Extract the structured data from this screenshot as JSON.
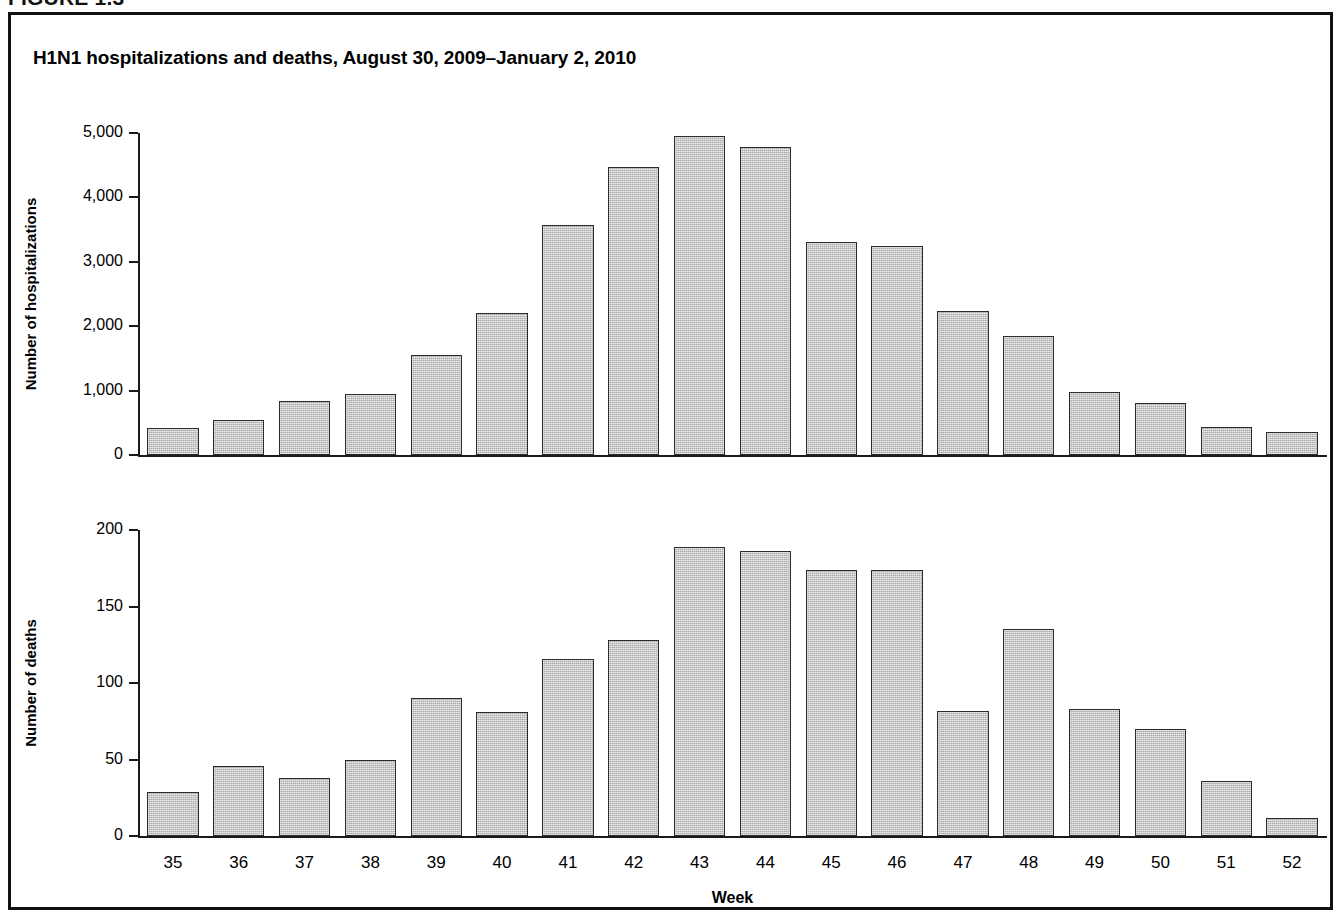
{
  "figure": {
    "header_label": "FIGURE 1.3",
    "title": "H1N1 hospitalizations and deaths, August 30, 2009–January 2, 2010"
  },
  "chart_data": [
    {
      "type": "bar",
      "panel": "top",
      "title": "",
      "xlabel": "",
      "ylabel": "Number of hospitalizations",
      "categories": [
        "35",
        "36",
        "37",
        "38",
        "39",
        "40",
        "41",
        "42",
        "43",
        "44",
        "45",
        "46",
        "47",
        "48",
        "49",
        "50",
        "51",
        "52"
      ],
      "values": [
        420,
        540,
        840,
        950,
        1550,
        2210,
        3570,
        4470,
        4960,
        4780,
        3300,
        3240,
        2230,
        1850,
        980,
        810,
        440,
        350
      ],
      "ylim": [
        0,
        5000
      ],
      "yticks": [
        0,
        1000,
        2000,
        3000,
        4000,
        5000
      ],
      "ytick_labels": [
        "0",
        "1,000",
        "2,000",
        "3,000",
        "4,000",
        "5,000"
      ],
      "grid": false,
      "legend": "none",
      "bar_color": "#a9a9a9",
      "bar_edge_color": "#2b2b2b"
    },
    {
      "type": "bar",
      "panel": "bottom",
      "title": "",
      "xlabel": "Week",
      "ylabel": "Number of deaths",
      "categories": [
        "35",
        "36",
        "37",
        "38",
        "39",
        "40",
        "41",
        "42",
        "43",
        "44",
        "45",
        "46",
        "47",
        "48",
        "49",
        "50",
        "51",
        "52"
      ],
      "values": [
        29,
        46,
        38,
        50,
        90,
        81,
        116,
        128,
        189,
        186,
        174,
        174,
        82,
        135,
        83,
        70,
        36,
        12
      ],
      "ylim": [
        0,
        200
      ],
      "yticks": [
        0,
        50,
        100,
        150,
        200
      ],
      "ytick_labels": [
        "0",
        "50",
        "100",
        "150",
        "200"
      ],
      "grid": false,
      "legend": "none",
      "bar_color": "#a9a9a9",
      "bar_edge_color": "#2b2b2b"
    }
  ]
}
